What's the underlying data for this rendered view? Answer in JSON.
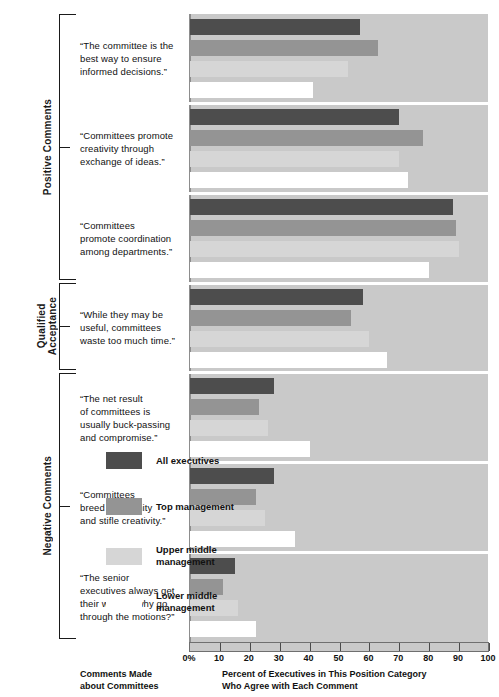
{
  "chart_data": {
    "type": "bar",
    "orientation": "horizontal",
    "title": "",
    "xlabel": "Percent of Executives in This Position Category\nWho Agree with Each Comment",
    "ylabel": "Comments Made\nabout Committees",
    "xlim": [
      0,
      100
    ],
    "xticks": [
      "0%",
      "10",
      "20",
      "30",
      "40",
      "50",
      "60",
      "70",
      "80",
      "90",
      "100"
    ],
    "xtick_values": [
      0,
      10,
      20,
      30,
      40,
      50,
      60,
      70,
      80,
      90,
      100
    ],
    "grid": false,
    "legend_position": "inside-lower-right",
    "categories": [
      "“The committee is the\nbest way to ensure\ninformed decisions.”",
      "“Committees promote\ncreativity through\nexchange of ideas.”",
      "“Committees\npromote coordination\namong departments.”",
      "“While they may be\nuseful, committees\nwaste too much time.”",
      "“The net result\nof committees is\nusually buck-passing\nand compromise.”",
      "“Committees\nbreed conformity\nand stifle creativity.”",
      "“The senior\nexecutives always get\ntheir way, so why go\nthrough the motions?”"
    ],
    "series": [
      {
        "name": "All executives",
        "color": "#4d4d4d",
        "values": [
          57,
          70,
          88,
          58,
          28,
          28,
          15
        ]
      },
      {
        "name": "Top management",
        "color": "#949494",
        "values": [
          63,
          78,
          89,
          54,
          23,
          22,
          11
        ]
      },
      {
        "name": "Upper middle\nmanagement",
        "color": "#d6d6d6",
        "values": [
          53,
          70,
          90,
          60,
          26,
          25,
          16
        ]
      },
      {
        "name": "Lower middle\nmanagement",
        "color": "#ffffff",
        "values": [
          41,
          73,
          80,
          66,
          40,
          35,
          22
        ]
      }
    ],
    "group_brackets": [
      {
        "label": "Positive Comments",
        "categories": [
          0,
          1,
          2
        ]
      },
      {
        "label": "Qualified\nAcceptance",
        "categories": [
          3
        ]
      },
      {
        "label": "Negative Comments",
        "categories": [
          4,
          5,
          6
        ]
      }
    ],
    "plot_background": "#c9c9c9"
  },
  "legend": {
    "items": [
      {
        "label": "All executives",
        "color": "#4d4d4d"
      },
      {
        "label": "Top management",
        "color": "#949494"
      },
      {
        "label": "Upper middle\nmanagement",
        "color": "#d6d6d6"
      },
      {
        "label": "Lower middle\nmanagement",
        "color": "#ffffff"
      }
    ]
  },
  "captions": {
    "left": "Comments Made\nabout Committees",
    "bottom": "Percent of Executives in This Position Category\nWho Agree with Each Comment"
  }
}
